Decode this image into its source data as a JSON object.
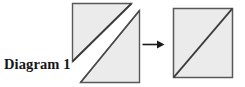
{
  "diagram": {
    "label": "Diagram 1",
    "type": "geometry-transformation",
    "background_color": "#ffffff",
    "shape_fill_color": "#ebebeb",
    "shape_stroke_color": "#58585a",
    "shape_diagonal_color": "#3c3c3e",
    "arrow_color": "#1a1a1a",
    "arrow_direction": "right",
    "left_figure": {
      "name": "square-cut-into-two-triangles",
      "description": "Square divided along its bottom-left to top-right diagonal into two right triangles, shown slightly separated",
      "pieces": [
        {
          "name": "upper-left-triangle",
          "vertices": "top-left, top-right, bottom-left"
        },
        {
          "name": "lower-right-triangle",
          "vertices": "top-right, bottom-right, bottom-left"
        }
      ]
    },
    "right_figure": {
      "name": "reassembled-square",
      "description": "Single square with a bottom-left to top-right diagonal",
      "pieces": [
        {
          "name": "whole-square",
          "vertices": "top-left, top-right, bottom-right, bottom-left"
        }
      ]
    }
  }
}
